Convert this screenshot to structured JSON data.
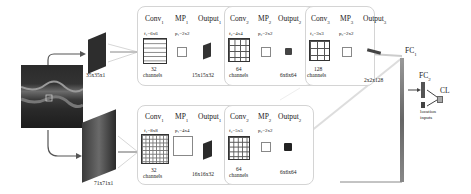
{
  "input": {
    "description": "OCT retinal B-scan image",
    "patch_small_label": "35x35x1",
    "patch_large_label": "71x71x1"
  },
  "top_branch": {
    "conv1": {
      "title": "Conv",
      "sub": "1",
      "filter": "f₁=6x6",
      "channels_n": "32",
      "channels": "channels"
    },
    "mp1": {
      "title": "MP",
      "sub": "1",
      "pool": "p₁=2x2"
    },
    "out1": {
      "title": "Output",
      "sub": "1",
      "size": "15x15x32"
    },
    "conv2": {
      "title": "Conv",
      "sub": "2",
      "filter": "f₂=4x4",
      "channels_n": "64",
      "channels": "channels"
    },
    "mp2": {
      "title": "MP",
      "sub": "2",
      "pool": "p₂=2x2"
    },
    "out2": {
      "title": "Output",
      "sub": "2",
      "size": "6x6x64"
    },
    "conv3": {
      "title": "Conv",
      "sub": "3",
      "filter": "f₃=3x3",
      "channels_n": "128",
      "channels": "channels"
    },
    "mp3": {
      "title": "MP",
      "sub": "3",
      "pool": "p₃=2x2"
    },
    "out3": {
      "title": "Output",
      "sub": "3",
      "size": "2x2x128"
    }
  },
  "bottom_branch": {
    "conv1": {
      "title": "Conv",
      "sub": "1",
      "filter": "f₁=8x8",
      "channels_n": "32",
      "channels": "channels"
    },
    "mp1": {
      "title": "MP",
      "sub": "1",
      "pool": "p₁=4x4"
    },
    "out1": {
      "title": "Output",
      "sub": "1",
      "size": "16x16x32"
    },
    "conv2": {
      "title": "Conv",
      "sub": "2",
      "filter": "f₂=5x5",
      "channels_n": "64",
      "channels": "channels"
    },
    "mp2": {
      "title": "MP",
      "sub": "2",
      "pool": "p₂=2x2"
    },
    "out2": {
      "title": "Output",
      "sub": "2",
      "size": "6x6x64"
    }
  },
  "head": {
    "fc1": {
      "title": "FC",
      "sub": "1"
    },
    "fc2": {
      "title": "FC",
      "sub": "2"
    },
    "cl": {
      "title": "CL"
    },
    "location_inputs": [
      "location",
      "inputs"
    ]
  }
}
